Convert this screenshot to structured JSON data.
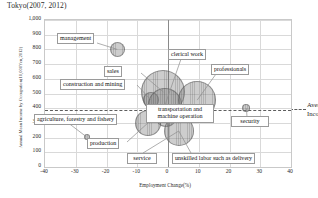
{
  "chart_data": {
    "type": "scatter",
    "subtype": "bubble",
    "title": "Tokyo(2007, 2012)",
    "xlabel": "Employment Change(%)",
    "ylabel": "Annual Mean Income by Occupation(10,000Yen,2012)",
    "xlim": [
      -40,
      40
    ],
    "ylim": [
      0,
      1000
    ],
    "xticks": [
      "-40",
      "-30",
      "-20",
      "-10",
      "0",
      "10",
      "20",
      "30",
      "40"
    ],
    "xtick_values": [
      -40,
      -30,
      -20,
      -10,
      0,
      10,
      20,
      30,
      40
    ],
    "yticks": [
      "0",
      "100",
      "200",
      "300",
      "400",
      "500",
      "600",
      "700",
      "800",
      "900",
      "1,000"
    ],
    "ytick_values": [
      0,
      100,
      200,
      300,
      400,
      500,
      600,
      700,
      800,
      900,
      1000
    ],
    "grid": true,
    "legend": "none",
    "bubble_color": "#888888",
    "reference_line": {
      "label_line1": "Average",
      "label_line2": "Income",
      "y_value": 385,
      "style": "dashed"
    },
    "points": [
      {
        "label": "management",
        "x": -16.5,
        "y": 800,
        "size": 7.5
      },
      {
        "label": "sales",
        "x": -1.5,
        "y": 510,
        "size": 22
      },
      {
        "label": "construction and mining",
        "x": -5.5,
        "y": 455,
        "size": 8
      },
      {
        "label": "agriculture, forestry and fishery",
        "x": -26.5,
        "y": 205,
        "size": 3
      },
      {
        "label": "clerical work",
        "x": -1.0,
        "y": 420,
        "size": 17
      },
      {
        "label": "professionals",
        "x": 9.5,
        "y": 455,
        "size": 19
      },
      {
        "label": "transportation and machine operation",
        "x": -0.5,
        "y": 350,
        "size": 11
      },
      {
        "label": "security",
        "x": 25.5,
        "y": 400,
        "size": 4
      },
      {
        "label": "production",
        "x": -6.5,
        "y": 300,
        "size": 13
      },
      {
        "label": "service",
        "x": 3.5,
        "y": 245,
        "size": 15
      },
      {
        "label": "unskilled labor such as delivery",
        "x": 3.5,
        "y": 245,
        "size": 15
      }
    ],
    "callouts": [
      {
        "name": "management",
        "text": "management"
      },
      {
        "name": "sales",
        "text": "sales"
      },
      {
        "name": "construction",
        "text": "construction and mining"
      },
      {
        "name": "agriculture",
        "text": "agriculture, forestry and fishery"
      },
      {
        "name": "clerical",
        "text": "clerical work"
      },
      {
        "name": "professionals",
        "text": "professionals"
      },
      {
        "name": "transport",
        "text": "transportation and\nmachine operation"
      },
      {
        "name": "transport1",
        "text": "transportation and"
      },
      {
        "name": "transport2",
        "text": "machine operation"
      },
      {
        "name": "security",
        "text": "security"
      },
      {
        "name": "production",
        "text": "production"
      },
      {
        "name": "service",
        "text": "service"
      },
      {
        "name": "unskilled",
        "text": "unskilled labor such as delivery"
      }
    ]
  }
}
